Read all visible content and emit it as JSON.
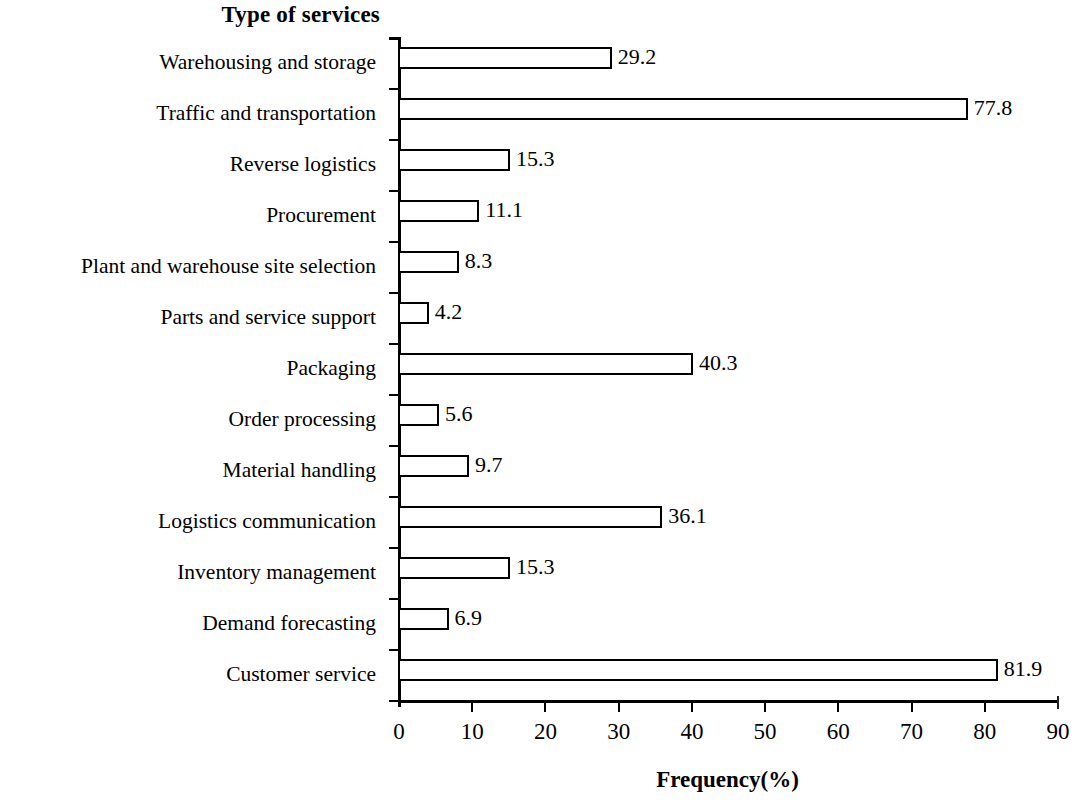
{
  "chart_data": {
    "type": "bar",
    "orientation": "horizontal",
    "title": "",
    "ylabel": "Type of services",
    "xlabel": "Frequency(%)",
    "xlim": [
      0,
      90
    ],
    "xticks": [
      0,
      10,
      20,
      30,
      40,
      50,
      60,
      70,
      80,
      90
    ],
    "xtick_labels": [
      "0",
      "10",
      "20",
      "30",
      "40",
      "50",
      "60",
      "70",
      "80",
      "90"
    ],
    "grid": false,
    "legend": null,
    "categories": [
      "Warehousing and storage",
      "Traffic and transportation",
      "Reverse logistics",
      "Procurement",
      "Plant and warehouse site selection",
      "Parts and service support",
      "Packaging",
      "Order processing",
      "Material handling",
      "Logistics communication",
      "Inventory management",
      "Demand forecasting",
      "Customer service"
    ],
    "values": [
      29.2,
      77.8,
      15.3,
      11.1,
      8.3,
      4.2,
      40.3,
      5.6,
      9.7,
      36.1,
      15.3,
      6.9,
      81.9
    ],
    "value_labels": [
      "29.2",
      "77.8",
      "15.3",
      "11.1",
      "8.3",
      "4.2",
      "40.3",
      "5.6",
      "9.7",
      "36.1",
      "15.3",
      "6.9",
      "81.9"
    ],
    "bar_fill": "#ffffff",
    "bar_edge": "#000000"
  }
}
